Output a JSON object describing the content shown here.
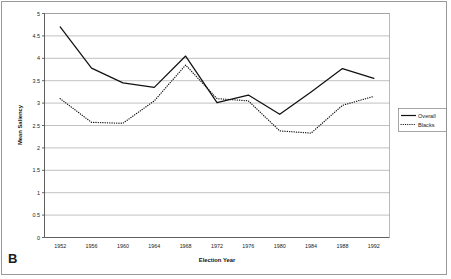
{
  "panel": {
    "letter": "B"
  },
  "chart_data": {
    "type": "line",
    "title": "",
    "xlabel": "Election Year",
    "ylabel": "Mean Saliency",
    "categories": [
      "1952",
      "1956",
      "1960",
      "1964",
      "1968",
      "1972",
      "1976",
      "1980",
      "1984",
      "1988",
      "1992"
    ],
    "x": [
      1952,
      1956,
      1960,
      1964,
      1968,
      1972,
      1976,
      1980,
      1984,
      1988,
      1992
    ],
    "series": [
      {
        "name": "Overall",
        "style": "solid",
        "color": "#111111",
        "values": [
          4.7,
          3.78,
          3.45,
          3.35,
          4.05,
          3.01,
          3.18,
          2.75,
          3.25,
          3.77,
          3.55
        ]
      },
      {
        "name": "Blacks",
        "style": "dotted",
        "color": "#111111",
        "values": [
          3.1,
          2.57,
          2.55,
          3.05,
          3.85,
          3.1,
          3.05,
          2.38,
          2.33,
          2.95,
          3.15
        ]
      }
    ],
    "ylim": [
      0,
      5
    ],
    "yticks": [
      "0",
      "0.5",
      "1",
      "1.5",
      "2",
      "2.5",
      "3",
      "3.5",
      "4",
      "4.5",
      "5"
    ],
    "ytick_values": [
      0,
      0.5,
      1,
      1.5,
      2,
      2.5,
      3,
      3.5,
      4,
      4.5,
      5
    ],
    "grid": true,
    "grid_axis": "y",
    "legend_position": "right",
    "legend_entries": [
      "Overall",
      "Blacks"
    ]
  }
}
